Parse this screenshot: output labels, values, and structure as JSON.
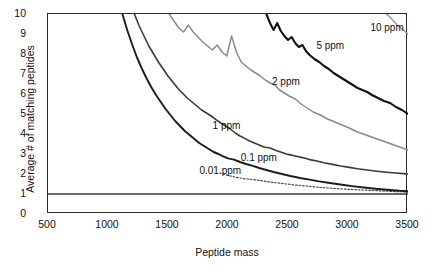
{
  "chart_data": {
    "type": "line",
    "title": "",
    "xlabel": "Peptide mass",
    "ylabel": "Average # of matching peptides",
    "xlim": [
      500,
      3500
    ],
    "ylim": [
      0,
      10
    ],
    "xticks": [
      500,
      1000,
      1500,
      2000,
      2500,
      3000,
      3500
    ],
    "yticks": [
      0,
      1,
      2,
      3,
      4,
      5,
      6,
      7,
      8,
      9,
      10
    ],
    "grid": false,
    "legend_position": "inline-annotations",
    "reference_lines": [
      {
        "name": "unity-line",
        "orientation": "horizontal",
        "y": 1,
        "style": "solid",
        "color": "#3a3a3a"
      }
    ],
    "series": [
      {
        "name": "0.01 ppm",
        "label": "0.01 ppm",
        "color": "#4a4a4a",
        "style": "dotted",
        "width": 1.2,
        "label_x": 1770,
        "label_y": 2.1,
        "x": [
          1930,
          2000,
          2070,
          2140,
          2210,
          2280,
          2350,
          2420,
          2490,
          2560,
          2630,
          2700,
          2770,
          2840,
          2910,
          2980,
          3050,
          3120,
          3190,
          3260,
          3330,
          3400,
          3470,
          3500
        ],
        "y": [
          2.05,
          1.93,
          1.83,
          1.76,
          1.72,
          1.66,
          1.6,
          1.55,
          1.5,
          1.45,
          1.41,
          1.37,
          1.33,
          1.3,
          1.27,
          1.24,
          1.22,
          1.2,
          1.18,
          1.16,
          1.14,
          1.12,
          1.11,
          1.1
        ]
      },
      {
        "name": "0.1 ppm",
        "label": "0.1 ppm",
        "color": "#1c1c1c",
        "style": "solid",
        "width": 1.9,
        "label_x": 2115,
        "label_y": 2.75,
        "x": [
          1120,
          1160,
          1200,
          1240,
          1280,
          1320,
          1360,
          1400,
          1440,
          1480,
          1520,
          1560,
          1600,
          1640,
          1680,
          1720,
          1760,
          1800,
          1840,
          1880,
          1920,
          1960,
          2000,
          2050,
          2100,
          2150,
          2200,
          2260,
          2320,
          2380,
          2450,
          2520,
          2600,
          2680,
          2760,
          2850,
          2950,
          3050,
          3150,
          3250,
          3350,
          3430,
          3500
        ],
        "y": [
          10,
          9.2,
          8.5,
          7.85,
          7.3,
          6.8,
          6.35,
          5.95,
          5.6,
          5.25,
          4.95,
          4.65,
          4.4,
          4.15,
          3.95,
          3.75,
          3.55,
          3.4,
          3.25,
          3.1,
          3.0,
          2.88,
          2.78,
          2.72,
          2.6,
          2.5,
          2.42,
          2.3,
          2.2,
          2.1,
          2.0,
          1.9,
          1.8,
          1.72,
          1.63,
          1.55,
          1.46,
          1.38,
          1.31,
          1.25,
          1.2,
          1.16,
          1.14
        ]
      },
      {
        "name": "1 ppm",
        "label": "1 ppm",
        "color": "#3a3a3a",
        "style": "solid",
        "width": 1.6,
        "label_x": 1880,
        "label_y": 4.35,
        "x": [
          1220,
          1260,
          1300,
          1340,
          1380,
          1420,
          1460,
          1500,
          1540,
          1580,
          1620,
          1660,
          1700,
          1740,
          1780,
          1820,
          1860,
          1900,
          1940,
          1980,
          2020,
          2060,
          2100,
          2140,
          2180,
          2220,
          2260,
          2300,
          2350,
          2400,
          2450,
          2500,
          2560,
          2620,
          2680,
          2740,
          2800,
          2870,
          2940,
          3010,
          3080,
          3160,
          3240,
          3320,
          3400,
          3460,
          3500
        ],
        "y": [
          10,
          9.4,
          8.9,
          8.4,
          8.0,
          7.6,
          7.25,
          6.9,
          6.6,
          6.3,
          6.05,
          5.8,
          5.6,
          5.4,
          5.2,
          5.05,
          4.9,
          4.72,
          4.55,
          4.4,
          4.25,
          4.05,
          3.9,
          3.78,
          3.65,
          3.55,
          3.45,
          3.35,
          3.3,
          3.18,
          3.08,
          2.98,
          2.9,
          2.82,
          2.72,
          2.65,
          2.56,
          2.48,
          2.4,
          2.33,
          2.26,
          2.2,
          2.14,
          2.09,
          2.05,
          2.02,
          2.0
        ]
      },
      {
        "name": "2 ppm",
        "label": "2 ppm",
        "color": "#8a8a8a",
        "style": "solid",
        "width": 1.5,
        "label_x": 2375,
        "label_y": 6.55,
        "x": [
          1510,
          1550,
          1590,
          1630,
          1670,
          1710,
          1750,
          1790,
          1830,
          1870,
          1910,
          1950,
          1990,
          2030,
          2070,
          2110,
          2150,
          2190,
          2230,
          2270,
          2310,
          2350,
          2390,
          2430,
          2470,
          2510,
          2560,
          2610,
          2660,
          2710,
          2770,
          2830,
          2890,
          2950,
          3010,
          3080,
          3150,
          3220,
          3290,
          3360,
          3430,
          3500
        ],
        "y": [
          10,
          9.65,
          9.3,
          9.1,
          9.45,
          9.1,
          8.85,
          8.6,
          8.4,
          8.2,
          8.45,
          8.1,
          7.9,
          8.9,
          8.1,
          7.6,
          7.4,
          7.2,
          7.05,
          6.9,
          6.7,
          6.55,
          6.45,
          6.2,
          6.05,
          5.9,
          5.75,
          5.5,
          5.3,
          5.1,
          4.95,
          4.75,
          4.6,
          4.45,
          4.3,
          4.1,
          3.95,
          3.8,
          3.65,
          3.5,
          3.35,
          3.2
        ]
      },
      {
        "name": "5 ppm",
        "label": "5 ppm",
        "color": "#111111",
        "style": "solid",
        "width": 2.1,
        "label_x": 2745,
        "label_y": 8.35,
        "x": [
          2320,
          2350,
          2380,
          2410,
          2440,
          2470,
          2500,
          2530,
          2560,
          2590,
          2620,
          2650,
          2680,
          2720,
          2760,
          2800,
          2840,
          2880,
          2920,
          2960,
          3000,
          3040,
          3080,
          3120,
          3160,
          3200,
          3250,
          3300,
          3350,
          3400,
          3450,
          3500
        ],
        "y": [
          10,
          9.55,
          9.2,
          9.55,
          9.15,
          8.9,
          8.7,
          8.85,
          8.55,
          8.35,
          8.45,
          8.15,
          7.95,
          7.75,
          7.6,
          7.4,
          7.25,
          7.05,
          6.9,
          6.75,
          6.6,
          6.45,
          6.3,
          6.2,
          6.1,
          5.95,
          5.8,
          5.65,
          5.55,
          5.35,
          5.2,
          5.0
        ]
      },
      {
        "name": "10 ppm",
        "label": "10 ppm",
        "color": "#9a9a9a",
        "style": "solid",
        "width": 1.5,
        "label_x": 3195,
        "label_y": 9.25,
        "x": [
          3320,
          3350,
          3380,
          3410,
          3440,
          3470,
          3500
        ],
        "y": [
          10,
          9.85,
          9.65,
          9.45,
          9.3,
          9.15,
          9.0
        ]
      }
    ]
  },
  "axes": {
    "y_tick_labels": [
      "10",
      "9",
      "8",
      "7",
      "6",
      "5",
      "4",
      "3",
      "2",
      "1",
      "0"
    ],
    "x_tick_labels": [
      "500",
      "1000",
      "1500",
      "2000",
      "2500",
      "3000",
      "3500"
    ],
    "y_axis_title": "Average # of matching peptides",
    "x_axis_title": "Peptide mass"
  }
}
